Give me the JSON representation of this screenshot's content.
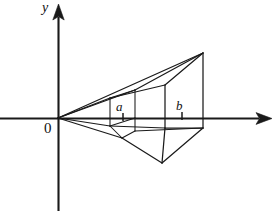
{
  "figure": {
    "type": "geometry-diagram",
    "background_color": "#ffffff",
    "ink_color": "#1a1a1a",
    "axes": {
      "x_axis": {
        "label": "",
        "origin_px": [
          58,
          118
        ],
        "start_px": [
          0,
          118
        ],
        "end_px": [
          272,
          118
        ],
        "arrow": "right"
      },
      "y_axis": {
        "label": "y",
        "origin_px": [
          58,
          118
        ],
        "start_px": [
          58,
          211
        ],
        "end_px": [
          58,
          6
        ],
        "arrow": "up"
      },
      "origin_label": "0"
    },
    "tick_labels": [
      {
        "name": "a",
        "text": "a",
        "x_px": 123,
        "tick_top_px": 113,
        "tick_bottom_px": 121
      },
      {
        "name": "b",
        "text": "b",
        "x_px": 182,
        "tick_top_px": 112,
        "tick_bottom_px": 120
      }
    ],
    "solid": {
      "description": "perspective wireframe of a solid with square cross-sections perpendicular to the x-axis, apex at the origin, widening toward x = b",
      "apex_px": [
        58,
        118
      ],
      "cross_section_a": {
        "label": "a",
        "front_top_left_px": [
          110,
          98
        ],
        "front_top_right_px": [
          135,
          90
        ],
        "front_bottom_right_px": [
          135,
          118
        ],
        "front_bottom_left_px": [
          110,
          126
        ],
        "lower_vertex_px": [
          122,
          138
        ]
      },
      "cross_section_b": {
        "label": "b",
        "front_top_left_px": [
          165,
          85
        ],
        "front_top_right_px": [
          203,
          53
        ],
        "front_bottom_right_px": [
          203,
          128
        ],
        "front_bottom_left_px": [
          165,
          128
        ],
        "lower_vertex_px": [
          162,
          163
        ]
      }
    }
  }
}
